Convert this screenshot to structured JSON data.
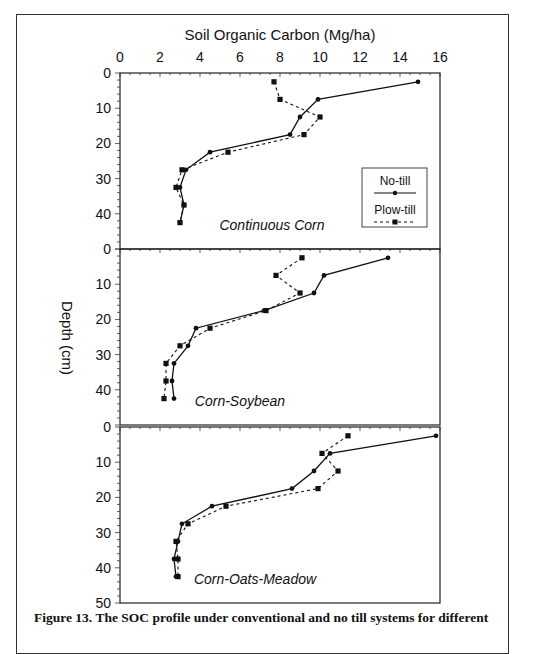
{
  "figure": {
    "caption": "Figure 13. The SOC profile under conventional and no till systems for different"
  },
  "chart_data": {
    "type": "line",
    "title": "",
    "xlabel": "Soil Organic Carbon (Mg/ha)",
    "ylabel": "Depth (cm)",
    "xlim": [
      0,
      16
    ],
    "ylim": [
      50,
      0
    ],
    "x_ticks": [
      0,
      2,
      4,
      6,
      8,
      10,
      12,
      14,
      16
    ],
    "y_ticks": [
      0,
      10,
      20,
      30,
      40,
      50
    ],
    "grid": false,
    "legend": {
      "position": "inside lower right of top panel",
      "entries": [
        {
          "label": "No-till",
          "style": "solid line, circle marker"
        },
        {
          "label": "Plow-till",
          "style": "dashed line, square marker"
        }
      ]
    },
    "panels": [
      {
        "name": "Continuous Corn",
        "depth": [
          2.5,
          7.5,
          12.5,
          17.5,
          22.5,
          27.5,
          32.5,
          37.5,
          42.5
        ],
        "series": [
          {
            "name": "No-till",
            "values": [
              14.9,
              9.9,
              9.0,
              8.5,
              4.5,
              3.3,
              3.0,
              3.2,
              3.0
            ]
          },
          {
            "name": "Plow-till",
            "values": [
              7.7,
              8.0,
              10.0,
              9.2,
              5.4,
              3.1,
              2.8,
              3.2,
              3.0
            ]
          }
        ]
      },
      {
        "name": "Corn-Soybean",
        "depth": [
          2.5,
          7.5,
          12.5,
          17.5,
          22.5,
          27.5,
          32.5,
          37.5,
          42.5
        ],
        "series": [
          {
            "name": "No-till",
            "values": [
              13.4,
              10.2,
              9.7,
              7.2,
              3.8,
              3.4,
              2.7,
              2.6,
              2.7
            ]
          },
          {
            "name": "Plow-till",
            "values": [
              9.1,
              7.8,
              9.0,
              7.3,
              4.5,
              3.0,
              2.3,
              2.3,
              2.2
            ]
          }
        ]
      },
      {
        "name": "Corn-Oats-Meadow",
        "depth": [
          2.5,
          7.5,
          12.5,
          17.5,
          22.5,
          27.5,
          32.5,
          37.5,
          42.5
        ],
        "series": [
          {
            "name": "No-till",
            "values": [
              15.8,
              10.5,
              9.7,
              8.6,
              4.6,
              3.1,
              2.9,
              2.7,
              2.8
            ]
          },
          {
            "name": "Plow-till",
            "values": [
              11.4,
              10.1,
              10.9,
              9.9,
              5.3,
              3.4,
              2.8,
              2.9,
              2.9
            ]
          }
        ]
      }
    ]
  }
}
